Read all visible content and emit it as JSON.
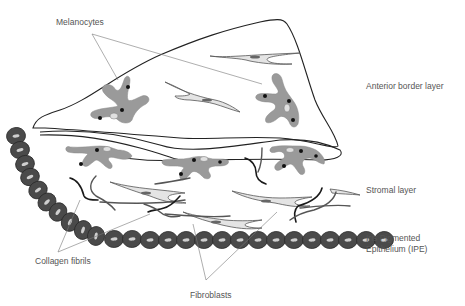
{
  "labels": {
    "melanocytes": "Melanocytes",
    "anterior_border_layer": "Anterior border layer",
    "stromal_layer": "Stromal layer",
    "ipe": "Iris Pigmented Epithelium (IPE)",
    "collagen_fibrils": "Collagen fibrils",
    "fibroblasts": "Fibroblasts"
  },
  "colors": {
    "melanocyte_fill": "#9a9a9a",
    "ipe_cell_fill": "#4a4a4a",
    "fibroblast_fill": "#e4e4e4",
    "outline": "#222222",
    "label_text": "#555555"
  }
}
